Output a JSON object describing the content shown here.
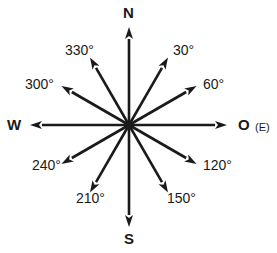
{
  "diagram": {
    "center": {
      "x": 129,
      "y": 125
    },
    "line_color": "#1a1a1a",
    "cardinals": [
      {
        "label": "N",
        "angle": 0,
        "length": 98
      },
      {
        "label": "O",
        "angle": 90,
        "length": 98,
        "note": "(E)"
      },
      {
        "label": "S",
        "angle": 180,
        "length": 102
      },
      {
        "label": "W",
        "angle": 270,
        "length": 99
      }
    ],
    "bearings": [
      {
        "label": "30°",
        "angle": 30,
        "length": 78
      },
      {
        "label": "60°",
        "angle": 60,
        "length": 78
      },
      {
        "label": "120°",
        "angle": 120,
        "length": 78
      },
      {
        "label": "150°",
        "angle": 150,
        "length": 78
      },
      {
        "label": "210°",
        "angle": 210,
        "length": 78
      },
      {
        "label": "240°",
        "angle": 240,
        "length": 78
      },
      {
        "label": "300°",
        "angle": 300,
        "length": 78
      },
      {
        "label": "330°",
        "angle": 330,
        "length": 78
      }
    ]
  },
  "labels": {
    "n": "N",
    "s": "S",
    "w": "W",
    "o": "O",
    "e_note": "(E)",
    "b30": "30°",
    "b60": "60°",
    "b120": "120°",
    "b150": "150°",
    "b210": "210°",
    "b240": "240°",
    "b300": "300°",
    "b330": "330°"
  }
}
